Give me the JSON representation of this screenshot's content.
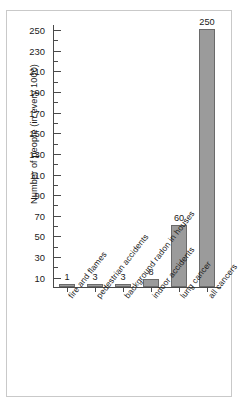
{
  "chart_data": {
    "type": "bar",
    "title": "",
    "xlabel": "",
    "ylabel": "Number of people (in every 1000)",
    "ylim": [
      0,
      255
    ],
    "ytick_step": 20,
    "yminor_step": 10,
    "grid": false,
    "legend": false,
    "categories": [
      "fire and flames",
      "pedestrian accidents",
      "background radon in houses",
      "indoor accidents",
      "lung cancer",
      "all cancers"
    ],
    "values": [
      1,
      3,
      3,
      8,
      60,
      250
    ],
    "value_labels": [
      "1",
      "3",
      "3",
      "8",
      "60",
      "250"
    ],
    "ytick_labels": [
      "10",
      "30",
      "50",
      "70",
      "90",
      "110",
      "130",
      "150",
      "170",
      "190",
      "210",
      "230",
      "250"
    ],
    "ytick_values": [
      10,
      30,
      50,
      70,
      90,
      110,
      130,
      150,
      170,
      190,
      210,
      230,
      250
    ],
    "bar_color": "#9b9b9b",
    "bar_edge_color": "#6a6a6a",
    "axis_color": "#4a4a4a",
    "text_color": "#1a1a1a",
    "frame_color": "#c9c9c9"
  }
}
